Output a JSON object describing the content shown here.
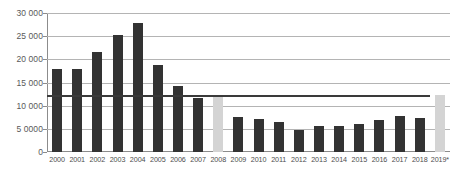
{
  "chart_data": {
    "type": "bar",
    "title": "",
    "subtitle": "",
    "xlabel": "",
    "ylabel": "",
    "ylim": [
      0,
      30000
    ],
    "grid": true,
    "legend": "none",
    "y_ticks": [
      0,
      5000,
      10000,
      15000,
      20000,
      25000,
      30000
    ],
    "y_tick_labels": [
      "0",
      "5 0000",
      "10 000",
      "15 000",
      "20 000",
      "25 000",
      "30 000"
    ],
    "categories": [
      "2000",
      "2001",
      "2002",
      "2003",
      "2004",
      "2005",
      "2006",
      "2007",
      "2008",
      "2009",
      "2010",
      "2011",
      "2012",
      "2013",
      "2014",
      "2015",
      "2016",
      "2017",
      "2018",
      "2019*"
    ],
    "values": [
      18000,
      18000,
      21500,
      25300,
      27800,
      18700,
      14300,
      11700,
      12300,
      7500,
      7200,
      6500,
      4800,
      5700,
      5600,
      6000,
      6900,
      7700,
      7300,
      12300
    ],
    "bar_colors": [
      "#333333",
      "#333333",
      "#333333",
      "#333333",
      "#333333",
      "#333333",
      "#333333",
      "#333333",
      "#d4d4d4",
      "#333333",
      "#333333",
      "#333333",
      "#333333",
      "#333333",
      "#333333",
      "#333333",
      "#333333",
      "#333333",
      "#333333",
      "#d4d4d4"
    ],
    "highlighted_categories": [
      "2008",
      "2019*"
    ],
    "reference_line": {
      "value": 12200,
      "color": "#3a3a3a"
    },
    "colors": {
      "bar": "#333333",
      "bar_highlight": "#d4d4d4",
      "gridline": "#b4b4b4",
      "axis": "#8c8c8c",
      "tick_text": "#595959",
      "background": "#ffffff"
    }
  }
}
